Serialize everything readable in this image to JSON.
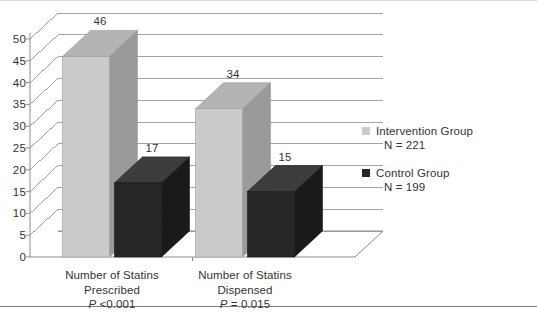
{
  "chart_data": {
    "type": "bar",
    "title": "",
    "subtitle": "",
    "xlabel": "",
    "ylabel": "",
    "ylim": [
      0,
      50
    ],
    "ytick_labels": [
      "50",
      "45",
      "40",
      "35",
      "30",
      "25",
      "20",
      "15",
      "10",
      "5",
      "0"
    ],
    "ytick_values": [
      50,
      45,
      40,
      35,
      30,
      25,
      20,
      15,
      10,
      5,
      0
    ],
    "grid": true,
    "three_d": true,
    "legend_position": "right",
    "categories": [
      {
        "line1": "Number of Statins",
        "line2": "Prescribed",
        "p_prefix": "P",
        "p_value": " <0.001"
      },
      {
        "line1": "Number of Statins",
        "line2": "Dispensed",
        "p_prefix": "P",
        "p_value": " = 0.015"
      }
    ],
    "series": [
      {
        "name": "Intervention Group",
        "subtitle": "N = 221",
        "color": "#cbcbcb",
        "side_color": "#9a9a9a",
        "top_color": "#b4b4b4",
        "values": [
          46,
          34
        ],
        "value_labels": [
          "46",
          "34"
        ]
      },
      {
        "name": "Control Group",
        "subtitle": "N = 199",
        "color": "#262626",
        "side_color": "#1a1a1a",
        "top_color": "#3d3d3d",
        "values": [
          17,
          15
        ],
        "value_labels": [
          "17",
          "15"
        ]
      }
    ]
  },
  "legend": {
    "entries": [
      {
        "label": "Intervention Group",
        "sub": "N = 221",
        "swatch": "#cbcbcb"
      },
      {
        "label": "Control Group",
        "sub": "N = 199",
        "swatch": "#262626"
      }
    ]
  },
  "axes": {
    "grid_color": "#9a9a9a",
    "axis_color": "#8d8d8d"
  }
}
